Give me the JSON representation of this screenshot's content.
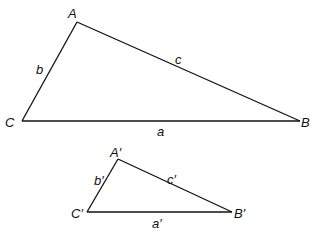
{
  "figure": {
    "triangles": [
      {
        "name": "large-triangle",
        "vertices": {
          "A": "A",
          "B": "B",
          "C": "C"
        },
        "sides": {
          "a": "a",
          "b": "b",
          "c": "c"
        }
      },
      {
        "name": "small-triangle",
        "vertices": {
          "A": "A′",
          "B": "B′",
          "C": "C′"
        },
        "sides": {
          "a": "a′",
          "b": "b′",
          "c": "c′"
        }
      }
    ]
  }
}
